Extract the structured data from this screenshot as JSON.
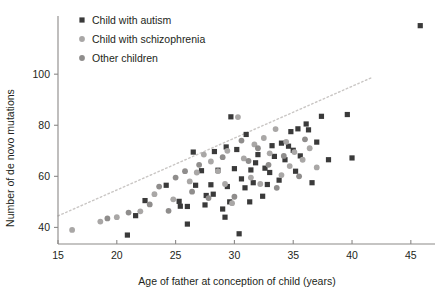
{
  "chart_data": {
    "type": "scatter",
    "title": "",
    "xlabel": "Age of father at conception of child (years)",
    "ylabel": "Number of de novo mutations",
    "xlim": [
      15,
      46.8
    ],
    "ylim": [
      33.5,
      122
    ],
    "xticks": [
      15,
      20,
      25,
      30,
      35,
      40,
      45
    ],
    "yticks": [
      40,
      60,
      80,
      100
    ],
    "grid": false,
    "legend_position": "top-left",
    "trendline": {
      "label": "fitted trend (dotted)",
      "style": "dotted",
      "color": "#c9c6c4",
      "x_start": 15.0,
      "y_start": 44.5,
      "x_end": 41.6,
      "y_end": 98.5
    },
    "series": [
      {
        "name": "Child with autism",
        "marker": "square",
        "color": "#3a3a3a",
        "points": [
          [
            20.9,
            37.0
          ],
          [
            21.6,
            44.6
          ],
          [
            22.4,
            50.5
          ],
          [
            24.2,
            56.5
          ],
          [
            25.3,
            50.2
          ],
          [
            25.4,
            48.3
          ],
          [
            26.0,
            48.2
          ],
          [
            26.0,
            41.3
          ],
          [
            26.5,
            69.5
          ],
          [
            26.7,
            56.5
          ],
          [
            27.2,
            62.2
          ],
          [
            27.5,
            48.8
          ],
          [
            27.6,
            52.5
          ],
          [
            28.0,
            56.7
          ],
          [
            28.2,
            53.0
          ],
          [
            28.3,
            69.7
          ],
          [
            28.6,
            62.4
          ],
          [
            29.0,
            47.2
          ],
          [
            29.2,
            44.0
          ],
          [
            29.3,
            71.5
          ],
          [
            29.4,
            56.0
          ],
          [
            29.6,
            50.0
          ],
          [
            29.7,
            83.3
          ],
          [
            30.0,
            63.0
          ],
          [
            30.2,
            70.5
          ],
          [
            30.4,
            37.5
          ],
          [
            30.6,
            59.0
          ],
          [
            30.9,
            55.5
          ],
          [
            31.0,
            76.4
          ],
          [
            31.3,
            50.0
          ],
          [
            31.4,
            62.5
          ],
          [
            31.6,
            57.5
          ],
          [
            31.8,
            65.3
          ],
          [
            32.0,
            68.5
          ],
          [
            32.4,
            52.2
          ],
          [
            32.6,
            63.2
          ],
          [
            32.8,
            56.8
          ],
          [
            33.0,
            61.5
          ],
          [
            33.2,
            72.0
          ],
          [
            33.4,
            67.8
          ],
          [
            33.8,
            58.5
          ],
          [
            34.0,
            73.0
          ],
          [
            34.3,
            66.5
          ],
          [
            34.6,
            71.8
          ],
          [
            34.8,
            77.5
          ],
          [
            35.0,
            70.2
          ],
          [
            35.2,
            62.0
          ],
          [
            35.4,
            78.6
          ],
          [
            35.6,
            68.0
          ],
          [
            36.1,
            80.5
          ],
          [
            36.3,
            78.2
          ],
          [
            36.6,
            57.5
          ],
          [
            37.0,
            73.4
          ],
          [
            37.4,
            83.5
          ],
          [
            38.0,
            66.5
          ],
          [
            39.6,
            84.2
          ],
          [
            40.0,
            67.2
          ],
          [
            45.8,
            119.0
          ]
        ]
      },
      {
        "name": "Child with schizophrenia",
        "marker": "circle",
        "color": "#a9a7a6",
        "points": [
          [
            16.2,
            39.0
          ],
          [
            18.6,
            42.3
          ],
          [
            20.0,
            44.0
          ],
          [
            22.0,
            46.3
          ],
          [
            23.2,
            53.0
          ],
          [
            24.8,
            51.0
          ],
          [
            26.2,
            58.0
          ],
          [
            26.8,
            61.5
          ],
          [
            27.4,
            68.5
          ],
          [
            28.0,
            65.8
          ],
          [
            28.6,
            62.0
          ],
          [
            29.2,
            57.0
          ],
          [
            29.4,
            70.0
          ],
          [
            29.8,
            49.5
          ],
          [
            30.3,
            83.2
          ],
          [
            30.8,
            67.0
          ],
          [
            31.4,
            59.5
          ],
          [
            31.7,
            72.5
          ],
          [
            32.2,
            57.0
          ],
          [
            32.5,
            75.0
          ],
          [
            33.0,
            69.0
          ],
          [
            33.5,
            78.5
          ],
          [
            34.0,
            60.5
          ],
          [
            34.4,
            73.5
          ],
          [
            34.7,
            64.0
          ],
          [
            35.1,
            69.5
          ],
          [
            35.8,
            66.5
          ],
          [
            36.4,
            71.0
          ],
          [
            37.0,
            63.5
          ]
        ]
      },
      {
        "name": "Other children",
        "marker": "circle",
        "color": "#8f8d8c",
        "points": [
          [
            19.2,
            43.5
          ],
          [
            21.0,
            45.8
          ],
          [
            22.8,
            49.0
          ],
          [
            23.6,
            56.0
          ],
          [
            24.4,
            46.5
          ],
          [
            25.0,
            59.5
          ],
          [
            25.8,
            62.0
          ],
          [
            26.4,
            54.0
          ],
          [
            27.0,
            64.5
          ],
          [
            27.8,
            51.5
          ],
          [
            29.0,
            67.5
          ],
          [
            30.0,
            52.0
          ],
          [
            30.6,
            74.0
          ],
          [
            31.2,
            66.0
          ],
          [
            32.0,
            71.0
          ],
          [
            32.9,
            64.5
          ],
          [
            33.6,
            55.5
          ],
          [
            34.2,
            68.0
          ],
          [
            35.5,
            60.0
          ],
          [
            36.0,
            74.5
          ]
        ]
      }
    ]
  },
  "legend": {
    "items": [
      {
        "label": "Child with autism",
        "marker": "square",
        "color": "#3a3a3a"
      },
      {
        "label": "Child with schizophrenia",
        "marker": "circle",
        "color": "#a9a7a6"
      },
      {
        "label": "Other children",
        "marker": "circle",
        "color": "#8f8d8c"
      }
    ]
  },
  "axes": {
    "x_tick_labels": [
      "15",
      "20",
      "25",
      "30",
      "35",
      "40",
      "45"
    ],
    "y_tick_labels": [
      "40",
      "60",
      "80",
      "100"
    ],
    "axis_color": "#8b8988"
  }
}
